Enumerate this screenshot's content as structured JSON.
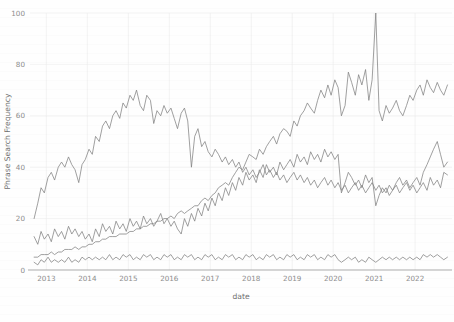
{
  "chart_data": {
    "type": "line",
    "title": "",
    "subtitle": "",
    "xlabel": "date",
    "ylabel": "Phrase Search Frequency",
    "xlim": [
      2012.6,
      2022.9
    ],
    "ylim": [
      0,
      100
    ],
    "grid": true,
    "legend_position": "bottom",
    "x_tick_labels": [
      "2013",
      "2014",
      "2015",
      "2016",
      "2017",
      "2018",
      "2019",
      "2020",
      "2021",
      "2022"
    ],
    "x_tick_values": [
      2013,
      2014,
      2015,
      2016,
      2017,
      2018,
      2019,
      2020,
      2021,
      2022
    ],
    "y_tick_labels": [
      "0",
      "20",
      "40",
      "60",
      "80",
      "100"
    ],
    "y_tick_values": [
      0,
      20,
      40,
      60,
      80,
      100
    ],
    "line_color": "#808080",
    "series": [
      {
        "name": "Artificial Intelligence",
        "color": "#808080",
        "x": [
          2012.7,
          2012.79,
          2012.87,
          2012.95,
          2013.04,
          2013.12,
          2013.2,
          2013.29,
          2013.37,
          2013.45,
          2013.54,
          2013.62,
          2013.7,
          2013.79,
          2013.87,
          2013.95,
          2014.04,
          2014.12,
          2014.2,
          2014.29,
          2014.37,
          2014.45,
          2014.54,
          2014.62,
          2014.7,
          2014.79,
          2014.87,
          2014.95,
          2015.04,
          2015.12,
          2015.2,
          2015.29,
          2015.37,
          2015.45,
          2015.54,
          2015.62,
          2015.7,
          2015.79,
          2015.87,
          2015.95,
          2016.04,
          2016.12,
          2016.2,
          2016.29,
          2016.37,
          2016.45,
          2016.54,
          2016.62,
          2016.7,
          2016.79,
          2016.87,
          2016.95,
          2017.04,
          2017.12,
          2017.2,
          2017.29,
          2017.37,
          2017.45,
          2017.54,
          2017.62,
          2017.7,
          2017.79,
          2017.87,
          2017.95,
          2018.04,
          2018.12,
          2018.2,
          2018.29,
          2018.37,
          2018.45,
          2018.54,
          2018.62,
          2018.7,
          2018.79,
          2018.87,
          2018.95,
          2019.04,
          2019.12,
          2019.2,
          2019.29,
          2019.37,
          2019.45,
          2019.54,
          2019.62,
          2019.7,
          2019.79,
          2019.87,
          2019.95,
          2020.04,
          2020.12,
          2020.2,
          2020.29,
          2020.37,
          2020.45,
          2020.54,
          2020.62,
          2020.7,
          2020.79,
          2020.87,
          2020.95,
          2021.04,
          2021.12,
          2021.2,
          2021.29,
          2021.37,
          2021.45,
          2021.54,
          2021.62,
          2021.7,
          2021.79,
          2021.87,
          2021.95,
          2022.04,
          2022.12,
          2022.2,
          2022.29,
          2022.37,
          2022.45,
          2022.54,
          2022.62,
          2022.7,
          2022.79
        ],
        "y": [
          5,
          5,
          6,
          6,
          6,
          7,
          6,
          7,
          7,
          8,
          8,
          8,
          9,
          8,
          9,
          9,
          10,
          10,
          11,
          11,
          12,
          12,
          13,
          13,
          13,
          14,
          14,
          14,
          15,
          15,
          16,
          16,
          17,
          17,
          18,
          18,
          19,
          19,
          20,
          20,
          21,
          20,
          22,
          23,
          22,
          23,
          24,
          25,
          25,
          27,
          28,
          27,
          29,
          30,
          32,
          33,
          34,
          33,
          36,
          38,
          40,
          39,
          42,
          45,
          44,
          43,
          47,
          45,
          48,
          50,
          52,
          49,
          53,
          55,
          54,
          52,
          58,
          56,
          60,
          62,
          65,
          63,
          61,
          66,
          70,
          67,
          72,
          68,
          74,
          71,
          60,
          64,
          77,
          73,
          68,
          76,
          72,
          78,
          66,
          74,
          100,
          62,
          58,
          64,
          61,
          63,
          66,
          62,
          60,
          64,
          68,
          66,
          70,
          72,
          68,
          74,
          71,
          69,
          73,
          70,
          68,
          72
        ]
      },
      {
        "name": "Big Data",
        "color": "#808080",
        "x": [
          2012.7,
          2012.79,
          2012.87,
          2012.95,
          2013.04,
          2013.12,
          2013.2,
          2013.29,
          2013.37,
          2013.45,
          2013.54,
          2013.62,
          2013.7,
          2013.79,
          2013.87,
          2013.95,
          2014.04,
          2014.12,
          2014.2,
          2014.29,
          2014.37,
          2014.45,
          2014.54,
          2014.62,
          2014.7,
          2014.79,
          2014.87,
          2014.95,
          2015.04,
          2015.12,
          2015.2,
          2015.29,
          2015.37,
          2015.45,
          2015.54,
          2015.62,
          2015.7,
          2015.79,
          2015.87,
          2015.95,
          2016.04,
          2016.12,
          2016.2,
          2016.29,
          2016.37,
          2016.45,
          2016.54,
          2016.62,
          2016.7,
          2016.79,
          2016.87,
          2016.95,
          2017.04,
          2017.12,
          2017.2,
          2017.29,
          2017.37,
          2017.45,
          2017.54,
          2017.62,
          2017.7,
          2017.79,
          2017.87,
          2017.95,
          2018.04,
          2018.12,
          2018.2,
          2018.29,
          2018.37,
          2018.45,
          2018.54,
          2018.62,
          2018.7,
          2018.79,
          2018.87,
          2018.95,
          2019.04,
          2019.12,
          2019.2,
          2019.29,
          2019.37,
          2019.45,
          2019.54,
          2019.62,
          2019.7,
          2019.79,
          2019.87,
          2019.95,
          2020.04,
          2020.12,
          2020.2,
          2020.29,
          2020.37,
          2020.45,
          2020.54,
          2020.62,
          2020.7,
          2020.79,
          2020.87,
          2020.95,
          2021.04,
          2021.12,
          2021.2,
          2021.29,
          2021.37,
          2021.45,
          2021.54,
          2021.62,
          2021.7,
          2021.79,
          2021.87,
          2021.95,
          2022.04,
          2022.12,
          2022.2,
          2022.29,
          2022.37,
          2022.45,
          2022.54,
          2022.62,
          2022.7,
          2022.79
        ],
        "y": [
          20,
          26,
          32,
          30,
          36,
          38,
          35,
          40,
          42,
          40,
          44,
          41,
          39,
          34,
          41,
          43,
          47,
          45,
          52,
          50,
          56,
          58,
          55,
          60,
          62,
          59,
          65,
          63,
          68,
          66,
          70,
          64,
          62,
          68,
          66,
          57,
          62,
          60,
          64,
          61,
          63,
          59,
          55,
          61,
          63,
          58,
          40,
          52,
          55,
          48,
          50,
          46,
          44,
          47,
          45,
          42,
          44,
          41,
          43,
          40,
          42,
          38,
          40,
          37,
          39,
          36,
          38,
          41,
          37,
          39,
          36,
          38,
          35,
          37,
          34,
          36,
          38,
          35,
          37,
          34,
          36,
          33,
          35,
          32,
          34,
          36,
          33,
          35,
          32,
          34,
          31,
          33,
          30,
          32,
          34,
          31,
          33,
          30,
          32,
          34,
          31,
          33,
          30,
          32,
          29,
          31,
          33,
          30,
          32,
          34,
          31,
          33,
          30,
          32,
          34,
          31,
          36,
          33,
          35,
          32,
          38,
          37
        ]
      },
      {
        "name": "data science",
        "color": "#808080",
        "x": [
          2012.7,
          2012.79,
          2012.87,
          2012.95,
          2013.04,
          2013.12,
          2013.2,
          2013.29,
          2013.37,
          2013.45,
          2013.54,
          2013.62,
          2013.7,
          2013.79,
          2013.87,
          2013.95,
          2014.04,
          2014.12,
          2014.2,
          2014.29,
          2014.37,
          2014.45,
          2014.54,
          2014.62,
          2014.7,
          2014.79,
          2014.87,
          2014.95,
          2015.04,
          2015.12,
          2015.2,
          2015.29,
          2015.37,
          2015.45,
          2015.54,
          2015.62,
          2015.7,
          2015.79,
          2015.87,
          2015.95,
          2016.04,
          2016.12,
          2016.2,
          2016.29,
          2016.37,
          2016.45,
          2016.54,
          2016.62,
          2016.7,
          2016.79,
          2016.87,
          2016.95,
          2017.04,
          2017.12,
          2017.2,
          2017.29,
          2017.37,
          2017.45,
          2017.54,
          2017.62,
          2017.7,
          2017.79,
          2017.87,
          2017.95,
          2018.04,
          2018.12,
          2018.2,
          2018.29,
          2018.37,
          2018.45,
          2018.54,
          2018.62,
          2018.7,
          2018.79,
          2018.87,
          2018.95,
          2019.04,
          2019.12,
          2019.2,
          2019.29,
          2019.37,
          2019.45,
          2019.54,
          2019.62,
          2019.7,
          2019.79,
          2019.87,
          2019.95,
          2020.04,
          2020.12,
          2020.2,
          2020.29,
          2020.37,
          2020.45,
          2020.54,
          2020.62,
          2020.7,
          2020.79,
          2020.87,
          2020.95,
          2021.04,
          2021.12,
          2021.2,
          2021.29,
          2021.37,
          2021.45,
          2021.54,
          2021.62,
          2021.7,
          2021.79,
          2021.87,
          2021.95,
          2022.04,
          2022.12,
          2022.2,
          2022.29,
          2022.37,
          2022.45,
          2022.54,
          2022.62,
          2022.7,
          2022.79
        ],
        "y": [
          13,
          10,
          15,
          12,
          14,
          11,
          16,
          13,
          15,
          12,
          17,
          14,
          16,
          13,
          15,
          12,
          14,
          11,
          16,
          13,
          18,
          15,
          17,
          14,
          19,
          16,
          18,
          15,
          20,
          17,
          19,
          16,
          21,
          18,
          20,
          17,
          19,
          22,
          18,
          20,
          17,
          19,
          16,
          14,
          20,
          17,
          22,
          19,
          24,
          21,
          26,
          23,
          28,
          25,
          30,
          27,
          32,
          29,
          34,
          31,
          36,
          33,
          38,
          35,
          37,
          34,
          39,
          36,
          41,
          38,
          40,
          37,
          42,
          39,
          41,
          43,
          40,
          45,
          42,
          44,
          41,
          46,
          43,
          45,
          42,
          47,
          44,
          46,
          43,
          45,
          30,
          34,
          38,
          36,
          33,
          35,
          32,
          37,
          34,
          36,
          25,
          29,
          32,
          30,
          33,
          31,
          34,
          36,
          33,
          35,
          32,
          34,
          36,
          33,
          38,
          41,
          44,
          47,
          50,
          45,
          40,
          42
        ]
      },
      {
        "name": "predictive analytics",
        "color": "#808080",
        "x": [
          2012.7,
          2012.79,
          2012.87,
          2012.95,
          2013.04,
          2013.12,
          2013.2,
          2013.29,
          2013.37,
          2013.45,
          2013.54,
          2013.62,
          2013.7,
          2013.79,
          2013.87,
          2013.95,
          2014.04,
          2014.12,
          2014.2,
          2014.29,
          2014.37,
          2014.45,
          2014.54,
          2014.62,
          2014.7,
          2014.79,
          2014.87,
          2014.95,
          2015.04,
          2015.12,
          2015.2,
          2015.29,
          2015.37,
          2015.45,
          2015.54,
          2015.62,
          2015.7,
          2015.79,
          2015.87,
          2015.95,
          2016.04,
          2016.12,
          2016.2,
          2016.29,
          2016.37,
          2016.45,
          2016.54,
          2016.62,
          2016.7,
          2016.79,
          2016.87,
          2016.95,
          2017.04,
          2017.12,
          2017.2,
          2017.29,
          2017.37,
          2017.45,
          2017.54,
          2017.62,
          2017.7,
          2017.79,
          2017.87,
          2017.95,
          2018.04,
          2018.12,
          2018.2,
          2018.29,
          2018.37,
          2018.45,
          2018.54,
          2018.62,
          2018.7,
          2018.79,
          2018.87,
          2018.95,
          2019.04,
          2019.12,
          2019.2,
          2019.29,
          2019.37,
          2019.45,
          2019.54,
          2019.62,
          2019.7,
          2019.79,
          2019.87,
          2019.95,
          2020.04,
          2020.12,
          2020.2,
          2020.29,
          2020.37,
          2020.45,
          2020.54,
          2020.62,
          2020.7,
          2020.79,
          2020.87,
          2020.95,
          2021.04,
          2021.12,
          2021.2,
          2021.29,
          2021.37,
          2021.45,
          2021.54,
          2021.62,
          2021.7,
          2021.79,
          2021.87,
          2021.95,
          2022.04,
          2022.12,
          2022.2,
          2022.29,
          2022.37,
          2022.45,
          2022.54,
          2022.62,
          2022.7,
          2022.79
        ],
        "y": [
          3,
          2,
          4,
          3,
          5,
          3,
          4,
          3,
          4,
          3,
          5,
          3,
          4,
          3,
          5,
          4,
          5,
          4,
          5,
          4,
          5,
          4,
          6,
          4,
          5,
          4,
          6,
          5,
          6,
          4,
          5,
          4,
          6,
          5,
          6,
          4,
          5,
          4,
          6,
          5,
          6,
          4,
          5,
          4,
          6,
          5,
          6,
          4,
          5,
          4,
          6,
          5,
          6,
          4,
          5,
          4,
          6,
          5,
          6,
          4,
          5,
          4,
          6,
          5,
          6,
          4,
          5,
          4,
          6,
          5,
          6,
          4,
          5,
          4,
          6,
          5,
          6,
          4,
          5,
          4,
          6,
          5,
          6,
          4,
          5,
          4,
          6,
          5,
          6,
          4,
          3,
          4,
          5,
          4,
          5,
          3,
          4,
          3,
          5,
          4,
          3,
          4,
          5,
          4,
          5,
          4,
          5,
          4,
          5,
          4,
          5,
          4,
          5,
          4,
          6,
          5,
          6,
          5,
          6,
          5,
          4,
          5
        ]
      }
    ]
  },
  "axes": {
    "ylabel": "Phrase Search Frequency",
    "xlabel": "date"
  },
  "legend": {
    "items": [
      {
        "label": "Artificial Intelligence"
      },
      {
        "label": "Big Data"
      },
      {
        "label": "data science"
      },
      {
        "label": "predictive analytics"
      }
    ]
  }
}
